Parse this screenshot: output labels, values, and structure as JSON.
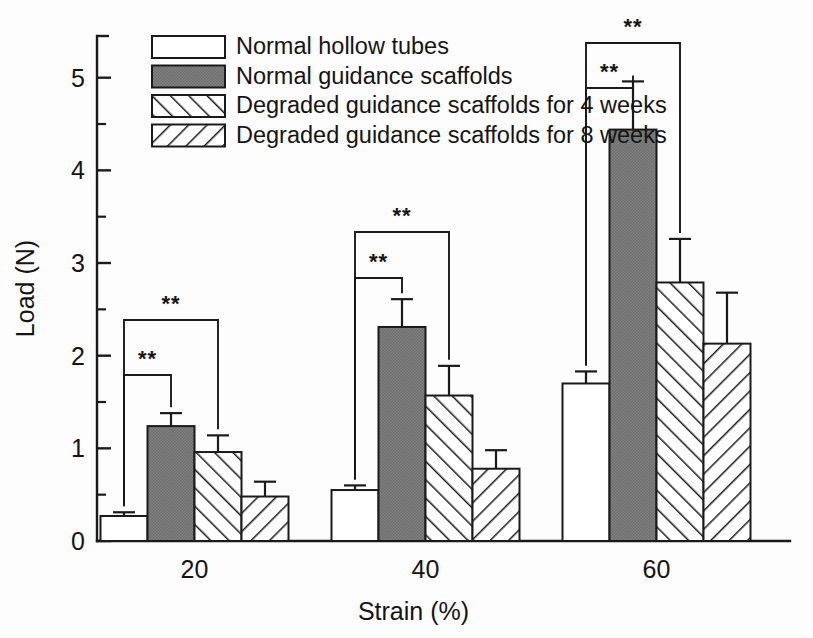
{
  "chart_data": {
    "type": "bar",
    "title": "",
    "xlabel": "Strain (%)",
    "ylabel": "Load (N)",
    "categories": [
      "20",
      "40",
      "60"
    ],
    "ylim": [
      0,
      5.45
    ],
    "yticks": [
      0,
      1,
      2,
      3,
      4,
      5
    ],
    "ytick_labels": [
      "0",
      "1",
      "2",
      "3",
      "4",
      "5"
    ],
    "yminor_ticks": [
      0.5,
      1.5,
      2.5,
      3.5,
      4.5
    ],
    "grid": false,
    "legend_position": "upper-left",
    "series": [
      {
        "name": "Normal hollow tubes",
        "pattern": "solid-white",
        "color": "#ffffff",
        "values": [
          0.27,
          0.55,
          1.7
        ],
        "errors": [
          0.04,
          0.05,
          0.13
        ]
      },
      {
        "name": "Normal guidance scaffolds",
        "pattern": "solid-gray",
        "color": "#7c7c7c",
        "values": [
          1.24,
          2.31,
          4.44
        ],
        "errors": [
          0.14,
          0.3,
          0.52
        ]
      },
      {
        "name": "Degraded guidance scaffolds for 4 weeks",
        "pattern": "hatch-forward",
        "color": "#ffffff",
        "values": [
          0.96,
          1.57,
          2.79
        ],
        "errors": [
          0.18,
          0.32,
          0.47
        ]
      },
      {
        "name": "Degraded guidance scaffolds for 8 weeks",
        "pattern": "hatch-backward",
        "color": "#ffffff",
        "values": [
          0.48,
          0.78,
          2.13
        ],
        "errors": [
          0.16,
          0.2,
          0.55
        ]
      }
    ],
    "annotations": [
      {
        "group": "20",
        "from": 0,
        "to": 1,
        "label": "**",
        "level": "inner"
      },
      {
        "group": "20",
        "from": 0,
        "to": 2,
        "label": "**",
        "level": "outer"
      },
      {
        "group": "40",
        "from": 0,
        "to": 1,
        "label": "**",
        "level": "inner"
      },
      {
        "group": "40",
        "from": 0,
        "to": 2,
        "label": "**",
        "level": "outer"
      },
      {
        "group": "60",
        "from": 0,
        "to": 1,
        "label": "**",
        "level": "inner"
      },
      {
        "group": "60",
        "from": 0,
        "to": 2,
        "label": "**",
        "level": "outer"
      }
    ]
  },
  "legend": {
    "items": [
      "Normal hollow tubes",
      "Normal guidance scaffolds",
      "Degraded guidance scaffolds for 4 weeks",
      "Degraded guidance scaffolds for 8 weeks"
    ]
  },
  "axes": {
    "y_title": "Load (N)",
    "x_title": "Strain (%)",
    "y_labels": [
      "0",
      "1",
      "2",
      "3",
      "4",
      "5"
    ],
    "x_labels": [
      "20",
      "40",
      "60"
    ]
  },
  "significance": {
    "stars": "**"
  },
  "colors": {
    "ink": "#1a1a1a",
    "gray_fill": "#7c7c7c",
    "background": "#fdfdfd"
  }
}
